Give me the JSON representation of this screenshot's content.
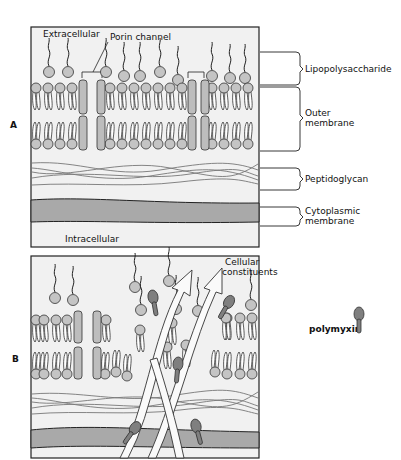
{
  "panels": {
    "A": {
      "letter": "A",
      "labels": {
        "extracellular": "Extracellular",
        "porin_channel": "Porin channel",
        "intracellular": "Intracellular"
      },
      "brackets": {
        "lps": "Lipopolysaccharide",
        "outer_1": "Outer",
        "outer_2": "membrane",
        "peptidoglycan": "Peptidoglycan",
        "cyto_1": "Cytoplasmic",
        "cyto_2": "membrane"
      }
    },
    "B": {
      "letter": "B",
      "labels": {
        "constituents_1": "Cellular",
        "constituents_2": "constituents"
      }
    }
  },
  "legend": {
    "label": "polymyxin",
    "icon": "polymyxin-molecule-icon"
  },
  "colors": {
    "panel_bg": "#f1f1f1",
    "lipid_head": "#c4c4c4",
    "porin": "#bdbdbd",
    "cytoplasmic_band": "#a9a9a9",
    "polymyxin": "#7f7f7f",
    "stroke": "#333333"
  }
}
